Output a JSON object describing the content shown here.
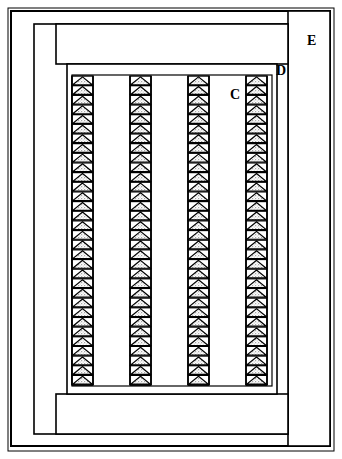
{
  "figure": {
    "type": "technical-line-drawing",
    "width": 342,
    "height": 459,
    "background_color": "#ffffff",
    "stroke_color": "#000000",
    "fill_color": "#ffffff",
    "stipple_color": "#9a9a9a"
  },
  "labels": [
    {
      "id": "label-e",
      "text": "E",
      "x": 307,
      "y": 34,
      "font_size": 14
    },
    {
      "id": "label-d",
      "text": "D",
      "x": 276,
      "y": 64,
      "font_size": 14
    },
    {
      "id": "label-c",
      "text": "C",
      "x": 230,
      "y": 88,
      "font_size": 14
    }
  ],
  "frames": [
    {
      "id": "outer-frame-outline",
      "x": 8,
      "y": 8,
      "width": 326,
      "height": 443,
      "stroke_width": 1
    },
    {
      "id": "outer-frame",
      "x": 11,
      "y": 11,
      "width": 319,
      "height": 435,
      "stroke_width": 2
    },
    {
      "id": "region-e-divider",
      "x": 288,
      "y": 11,
      "width": 42,
      "height": 435,
      "stroke_width": 1.6
    },
    {
      "id": "inner-body-frame",
      "x": 34,
      "y": 24,
      "width": 254,
      "height": 410,
      "stroke_width": 1.6
    },
    {
      "id": "upper-band",
      "x": 56,
      "y": 24,
      "width": 232,
      "height": 40,
      "stroke_width": 1.6
    },
    {
      "id": "lower-band",
      "x": 56,
      "y": 394,
      "width": 232,
      "height": 40,
      "stroke_width": 1.6
    },
    {
      "id": "core-chamber",
      "x": 67,
      "y": 64,
      "width": 210,
      "height": 330,
      "stroke_width": 1.6
    },
    {
      "id": "core-chamber-inner",
      "x": 72,
      "y": 75,
      "width": 200,
      "height": 311,
      "stroke_width": 1.2
    }
  ],
  "columns": {
    "count": 4,
    "triangle_width": 21,
    "triangle_height": 9.6,
    "top_y": 76,
    "bottom_y": 385,
    "triangles_per_column": 32,
    "x_positions": [
      72,
      130,
      188,
      246
    ]
  },
  "chart_data": {
    "type": "table",
    "columns": [
      "Callout",
      "Region"
    ],
    "rows": [
      [
        "C",
        "Interior chamber space between triangle columns"
      ],
      [
        "D",
        "Chamber boundary wall"
      ],
      [
        "E",
        "Outer housing margin"
      ]
    ]
  }
}
